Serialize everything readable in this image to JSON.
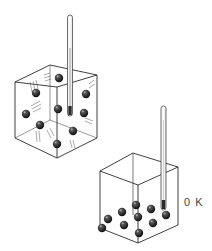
{
  "figure": {
    "panels": [
      {
        "name": "hot-gas-cube",
        "description": "Cube with particles spread throughout, in motion (motion lines), thermometer inserted",
        "particle_count": 9,
        "thermometer_label": ""
      },
      {
        "name": "zero-kelvin-cube",
        "description": "Cube with particles resting motionless on the floor, thermometer reading absolute zero",
        "particle_count": 12,
        "thermometer_label": "0 K"
      }
    ]
  },
  "colors": {
    "line": "#2b2b2b",
    "particle": "#1e1e1e",
    "background": "#ffffff"
  }
}
